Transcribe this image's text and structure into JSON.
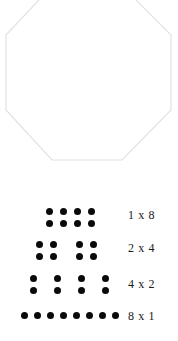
{
  "shape": {
    "name": "octagon",
    "sides": 8,
    "outline_color": "#e2e2e2",
    "fill_color": "#ffffff",
    "stroke_width": 1,
    "cropped_at_top": true
  },
  "dot_color": "#0a0a0a",
  "total_dots_per_row": 8,
  "rows": [
    {
      "label": "1 x 8",
      "groups": 1,
      "per_group": 8,
      "group_cols": 4,
      "group_rows": 2,
      "dots_x": [
        46,
        60,
        74,
        88
      ],
      "dots_y": [
        8,
        20
      ],
      "group_origins": [
        40
      ]
    },
    {
      "label": "2 x 4",
      "groups": 2,
      "per_group": 4,
      "group_cols": 2,
      "group_rows": 2,
      "dots_x": [
        36,
        50
      ],
      "dots_y": [
        8,
        20
      ],
      "group_origins": [
        36,
        76
      ]
    },
    {
      "label": "4 x 2",
      "groups": 4,
      "per_group": 2,
      "group_cols": 1,
      "group_rows": 2,
      "dots_x": [
        30
      ],
      "dots_y": [
        8,
        20
      ],
      "group_origins": [
        30,
        54,
        78,
        102
      ]
    },
    {
      "label": "8 x 1",
      "groups": 8,
      "per_group": 1,
      "group_cols": 1,
      "group_rows": 1,
      "dots_x": [
        21,
        34,
        47,
        60,
        73,
        86,
        99,
        112
      ],
      "dots_y": [
        12
      ],
      "group_origins": [
        21,
        34,
        47,
        60,
        73,
        86,
        99,
        112
      ]
    }
  ]
}
